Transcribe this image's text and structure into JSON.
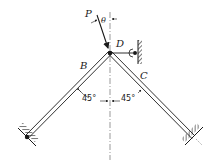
{
  "diagram": {
    "labels": {
      "load": "P",
      "angle_theta": "θ",
      "joint": "D",
      "member_left": "B",
      "member_right": "C",
      "angle_left": "45°",
      "angle_right": "45°"
    },
    "colors": {
      "ink": "#1a1a1a",
      "background": "#ffffff"
    }
  }
}
